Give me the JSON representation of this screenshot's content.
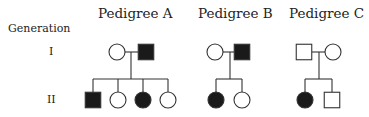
{
  "generation_header": "Generation",
  "generations": [
    {
      "label": "I",
      "y": 52
    },
    {
      "label": "II",
      "y": 100
    }
  ],
  "colors": {
    "line": "#333333",
    "affected": "#1a1a1a",
    "unaffected": "#ffffff"
  },
  "pedigrees": [
    {
      "title": "Pedigree A",
      "title_x": 98,
      "parents": [
        {
          "sex": "female",
          "affected": false,
          "cx": 117,
          "cy": 52
        },
        {
          "sex": "male",
          "affected": true,
          "cx": 146,
          "cy": 52
        }
      ],
      "marriage_line": {
        "x1": 125,
        "x2": 138,
        "y": 52
      },
      "descent_x": 131,
      "sibship_y": 79,
      "children": [
        {
          "sex": "male",
          "affected": true,
          "cx": 93,
          "cy": 100
        },
        {
          "sex": "female",
          "affected": false,
          "cx": 118,
          "cy": 100
        },
        {
          "sex": "female",
          "affected": true,
          "cx": 143,
          "cy": 100
        },
        {
          "sex": "female",
          "affected": false,
          "cx": 168,
          "cy": 100
        }
      ]
    },
    {
      "title": "Pedigree B",
      "title_x": 198,
      "parents": [
        {
          "sex": "female",
          "affected": false,
          "cx": 215,
          "cy": 52
        },
        {
          "sex": "male",
          "affected": true,
          "cx": 242,
          "cy": 52
        }
      ],
      "marriage_line": {
        "x1": 223,
        "x2": 234,
        "y": 52
      },
      "descent_x": 230,
      "sibship_y": 79,
      "children": [
        {
          "sex": "female",
          "affected": true,
          "cx": 216,
          "cy": 100
        },
        {
          "sex": "female",
          "affected": false,
          "cx": 242,
          "cy": 100
        }
      ]
    },
    {
      "title": "Pedigree C",
      "title_x": 289,
      "parents": [
        {
          "sex": "male",
          "affected": false,
          "cx": 304,
          "cy": 52
        },
        {
          "sex": "female",
          "affected": false,
          "cx": 333,
          "cy": 52
        }
      ],
      "marriage_line": {
        "x1": 312,
        "x2": 325,
        "y": 52
      },
      "descent_x": 319,
      "sibship_y": 79,
      "children": [
        {
          "sex": "female",
          "affected": true,
          "cx": 305,
          "cy": 100
        },
        {
          "sex": "male",
          "affected": false,
          "cx": 332,
          "cy": 100
        }
      ]
    }
  ]
}
